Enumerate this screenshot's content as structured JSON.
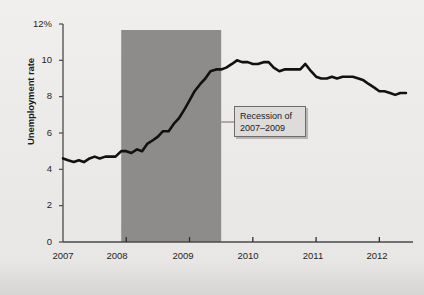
{
  "chart_data": {
    "type": "line",
    "title": "",
    "xlabel": "",
    "ylabel": "Unemployment rate",
    "ylim": [
      0,
      12
    ],
    "xlim": [
      2007.0,
      2012.5
    ],
    "grid": false,
    "legend": "none",
    "y_ticks": [
      "0",
      "2",
      "4",
      "6",
      "8",
      "10",
      "12%"
    ],
    "y_tick_values": [
      0,
      2,
      4,
      6,
      8,
      10,
      12
    ],
    "x_ticks": [
      "2007",
      "2008",
      "2009",
      "2010",
      "2011",
      "2012"
    ],
    "x_tick_values": [
      2007,
      2008,
      2009,
      2010,
      2011,
      2012
    ],
    "series": [
      {
        "name": "Unemployment rate",
        "color": "#111111",
        "x": [
          2007.0,
          2007.08,
          2007.17,
          2007.25,
          2007.33,
          2007.42,
          2007.5,
          2007.58,
          2007.67,
          2007.75,
          2007.83,
          2007.92,
          2008.0,
          2008.08,
          2008.17,
          2008.25,
          2008.33,
          2008.42,
          2008.5,
          2008.58,
          2008.67,
          2008.75,
          2008.83,
          2008.92,
          2009.0,
          2009.08,
          2009.17,
          2009.25,
          2009.33,
          2009.42,
          2009.5,
          2009.58,
          2009.67,
          2009.75,
          2009.83,
          2009.92,
          2010.0,
          2010.08,
          2010.17,
          2010.25,
          2010.33,
          2010.42,
          2010.5,
          2010.58,
          2010.67,
          2010.75,
          2010.83,
          2010.92,
          2011.0,
          2011.08,
          2011.17,
          2011.25,
          2011.33,
          2011.42,
          2011.5,
          2011.58,
          2011.67,
          2011.75,
          2011.83,
          2011.92,
          2012.0,
          2012.08,
          2012.17,
          2012.25,
          2012.33,
          2012.42
        ],
        "values": [
          4.6,
          4.5,
          4.4,
          4.5,
          4.4,
          4.6,
          4.7,
          4.6,
          4.7,
          4.7,
          4.7,
          5.0,
          5.0,
          4.9,
          5.1,
          5.0,
          5.4,
          5.6,
          5.8,
          6.1,
          6.1,
          6.5,
          6.8,
          7.3,
          7.8,
          8.3,
          8.7,
          9.0,
          9.4,
          9.5,
          9.5,
          9.6,
          9.8,
          10.0,
          9.9,
          9.9,
          9.8,
          9.8,
          9.9,
          9.9,
          9.6,
          9.4,
          9.5,
          9.5,
          9.5,
          9.5,
          9.8,
          9.4,
          9.1,
          9.0,
          9.0,
          9.1,
          9.0,
          9.1,
          9.1,
          9.1,
          9.0,
          8.9,
          8.7,
          8.5,
          8.3,
          8.3,
          8.2,
          8.1,
          8.2,
          8.2
        ]
      }
    ],
    "shaded_regions": [
      {
        "name": "recession-band",
        "label_line_1": "Recession of",
        "label_line_2": "2007–2009",
        "x_start": 2007.92,
        "x_end": 2009.5,
        "color": "#8e8c8a"
      }
    ]
  },
  "annotation": {
    "line1": "Recession of",
    "line2": "2007–2009"
  },
  "axes": {
    "y_label": "Unemployment rate"
  }
}
